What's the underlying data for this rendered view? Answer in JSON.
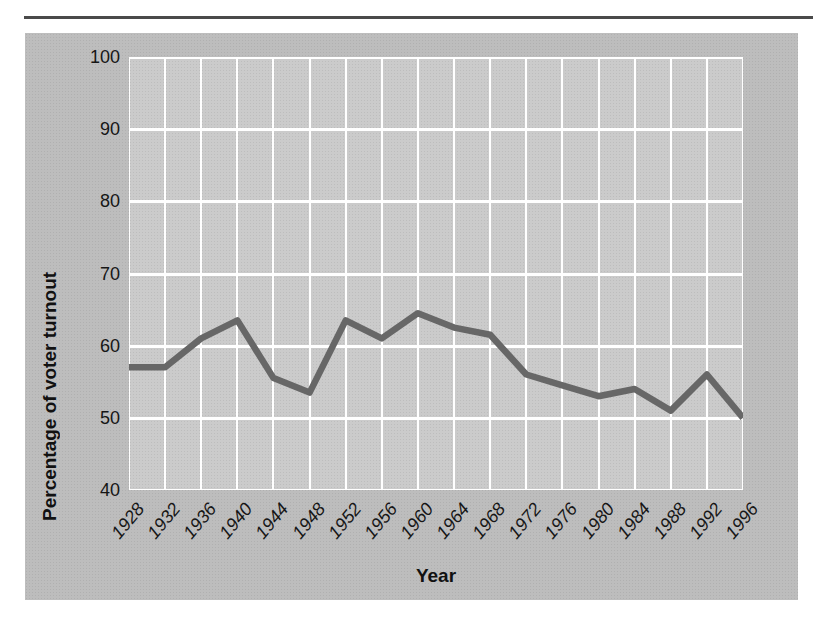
{
  "top_rule": {
    "color": "#4a4a4a"
  },
  "chart_data": {
    "type": "line",
    "title": "",
    "xlabel": "Year",
    "ylabel": "Percentage of voter turnout",
    "x": [
      1928,
      1932,
      1936,
      1940,
      1944,
      1948,
      1952,
      1956,
      1960,
      1964,
      1968,
      1972,
      1976,
      1980,
      1984,
      1988,
      1992,
      1996
    ],
    "series": [
      {
        "name": "Percentage of voter turnout",
        "values": [
          57,
          57,
          61,
          63.5,
          55.5,
          53.5,
          63.5,
          61,
          64.5,
          62.5,
          61.5,
          56,
          54.5,
          53,
          54,
          51,
          56,
          50
        ]
      }
    ],
    "ylim": [
      40,
      100
    ],
    "yticks": [
      100,
      90,
      80,
      70,
      60,
      50,
      40
    ],
    "grid": true,
    "legend": "none",
    "colors": {
      "figure_bg": "#bbbbbb",
      "plot_bg": "#c9c9c9",
      "grid": "#ffffff",
      "line": "#676767",
      "text": "#161616"
    }
  }
}
